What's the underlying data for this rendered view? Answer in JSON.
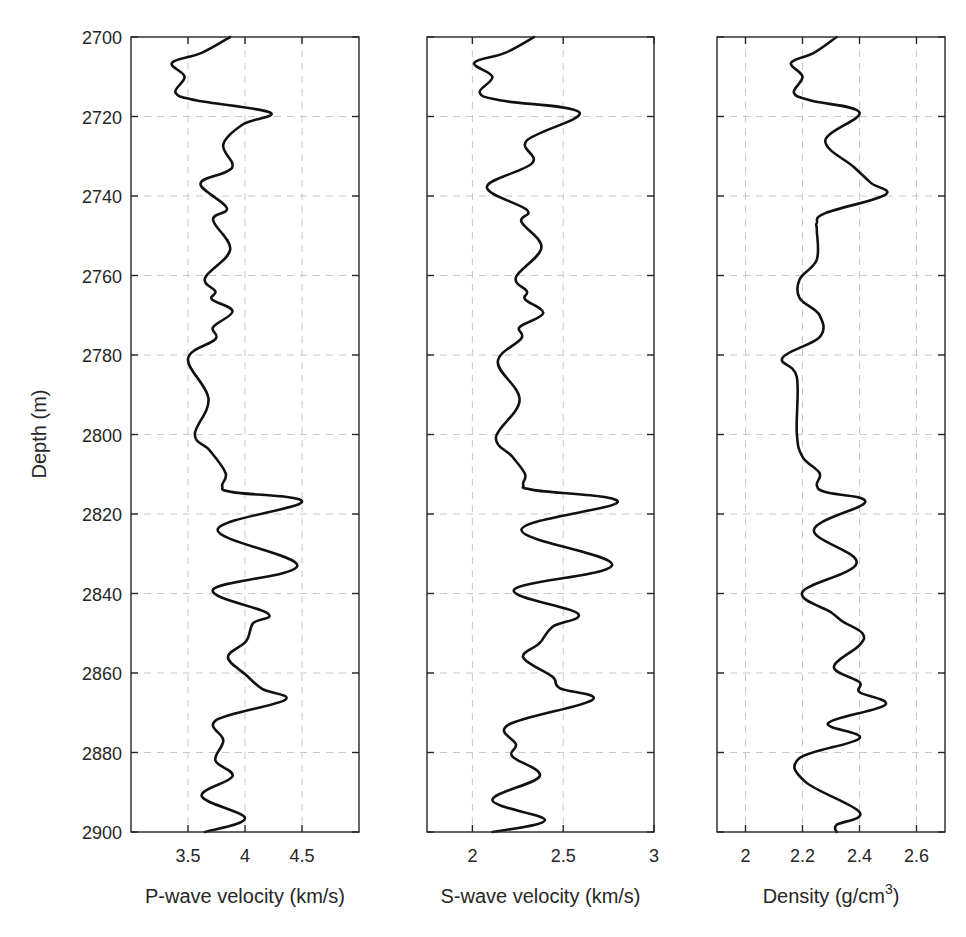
{
  "figure": {
    "ylabel": "Depth (m)",
    "ylim": [
      2700,
      2900
    ],
    "y_reversed": true,
    "yticks": [
      2700,
      2720,
      2740,
      2760,
      2780,
      2800,
      2820,
      2840,
      2860,
      2880,
      2900
    ],
    "line_color": "#111111",
    "grid_color": "#c8c8c8",
    "axis_color": "#262626"
  },
  "chart_data": [
    {
      "type": "line",
      "title": "",
      "xlabel": "P-wave velocity (km/s)",
      "ylabel": "Depth (m)",
      "xlim": [
        3.0,
        5.0
      ],
      "ylim": [
        2700,
        2900
      ],
      "xticks": [
        3.5,
        4,
        4.5
      ],
      "xtick_labels": [
        "3.5",
        "4",
        "4.5"
      ],
      "grid": true,
      "series": [
        {
          "name": "P-wave velocity",
          "x": [
            3.87,
            3.62,
            3.36,
            3.47,
            3.39,
            3.58,
            4.22,
            3.98,
            3.81,
            3.89,
            3.83,
            3.61,
            3.84,
            3.72,
            3.87,
            3.65,
            3.74,
            3.71,
            3.89,
            3.72,
            3.74,
            3.5,
            3.68,
            3.56,
            3.69,
            3.83,
            3.8,
            3.89,
            4.5,
            3.76,
            4.46,
            3.72,
            4.2,
            4.07,
            4.01,
            3.85,
            4.01,
            4.15,
            4.35,
            3.75,
            3.81,
            3.74,
            3.89,
            3.62,
            4.0,
            3.65
          ],
          "y": [
            2700,
            2704,
            2706.5,
            2710,
            2714,
            2716,
            2719,
            2722,
            2727,
            2732,
            2734,
            2737,
            2743,
            2746,
            2753.5,
            2760.6,
            2764,
            2766,
            2769,
            2773,
            2776,
            2781,
            2791,
            2800,
            2804,
            2809.7,
            2813,
            2814.5,
            2817,
            2824,
            2833,
            2839,
            2845,
            2847.5,
            2852,
            2856,
            2860.5,
            2864,
            2866.8,
            2871.8,
            2877,
            2882,
            2886,
            2891,
            2896.5,
            2900
          ]
        }
      ]
    },
    {
      "type": "line",
      "title": "",
      "xlabel": "S-wave velocity (km/s)",
      "ylabel": "",
      "xlim": [
        1.75,
        3.0
      ],
      "ylim": [
        2700,
        2900
      ],
      "xticks": [
        2,
        2.5,
        3
      ],
      "xtick_labels": [
        "2",
        "2.5",
        "3"
      ],
      "grid": true,
      "series": [
        {
          "name": "S-wave velocity",
          "x": [
            2.34,
            2.18,
            2.01,
            2.11,
            2.04,
            2.16,
            2.59,
            2.3,
            2.33,
            2.08,
            2.3,
            2.27,
            2.38,
            2.24,
            2.3,
            2.29,
            2.39,
            2.26,
            2.27,
            2.14,
            2.26,
            2.13,
            2.22,
            2.29,
            2.28,
            2.34,
            2.8,
            2.27,
            2.77,
            2.23,
            2.58,
            2.44,
            2.37,
            2.28,
            2.44,
            2.48,
            2.66,
            2.2,
            2.24,
            2.22,
            2.37,
            2.11,
            2.4,
            2.11
          ],
          "y": [
            2700,
            2704,
            2706.5,
            2710,
            2714,
            2716,
            2719,
            2726,
            2731.7,
            2737.7,
            2743.5,
            2746.5,
            2753,
            2760.4,
            2764,
            2766,
            2769.5,
            2773,
            2775.8,
            2781.8,
            2791.3,
            2800.6,
            2805.6,
            2810,
            2812.7,
            2814,
            2817,
            2824,
            2832.8,
            2839,
            2845,
            2848.4,
            2852.5,
            2856.1,
            2860.9,
            2863.8,
            2866.8,
            2873,
            2878,
            2881,
            2886,
            2892,
            2897,
            2900
          ]
        }
      ]
    },
    {
      "type": "line",
      "title": "",
      "xlabel": "Density (g/cm³)",
      "xlabel_base": "Density (g/cm",
      "xlabel_sup": "3",
      "xlabel_tail": ")",
      "ylabel": "",
      "xlim": [
        1.9,
        2.7
      ],
      "ylim": [
        2700,
        2900
      ],
      "xticks": [
        2,
        2.2,
        2.4,
        2.6
      ],
      "xtick_labels": [
        "2",
        "2.2",
        "2.4",
        "2.6"
      ],
      "grid": true,
      "series": [
        {
          "name": "Density",
          "x": [
            2.32,
            2.24,
            2.16,
            2.2,
            2.17,
            2.23,
            2.4,
            2.28,
            2.38,
            2.44,
            2.49,
            2.28,
            2.25,
            2.25,
            2.25,
            2.19,
            2.19,
            2.26,
            2.26,
            2.13,
            2.18,
            2.18,
            2.2,
            2.26,
            2.25,
            2.28,
            2.42,
            2.24,
            2.39,
            2.2,
            2.3,
            2.34,
            2.41,
            2.4,
            2.31,
            2.4,
            2.4,
            2.49,
            2.29,
            2.4,
            2.19,
            2.21,
            2.4,
            2.32,
            2.32
          ],
          "y": [
            2700,
            2704,
            2706.5,
            2710,
            2714,
            2716,
            2719,
            2726,
            2732.7,
            2736.7,
            2739.7,
            2744.3,
            2746.8,
            2756,
            2748.5,
            2761,
            2765.7,
            2770,
            2775.5,
            2780.7,
            2785.5,
            2799.6,
            2805.6,
            2809.7,
            2812.7,
            2814.5,
            2817,
            2824,
            2832.3,
            2839.6,
            2844.7,
            2847,
            2850,
            2853,
            2858.5,
            2862.3,
            2864.8,
            2868,
            2872.6,
            2876.4,
            2881.4,
            2887.4,
            2895,
            2898.2,
            2900
          ]
        }
      ]
    }
  ],
  "layout_panels": [
    {
      "left": 131,
      "right": 359
    },
    {
      "left": 427,
      "right": 654
    },
    {
      "left": 717,
      "right": 945
    }
  ],
  "layout_plot": {
    "top": 37,
    "bottom": 832
  }
}
